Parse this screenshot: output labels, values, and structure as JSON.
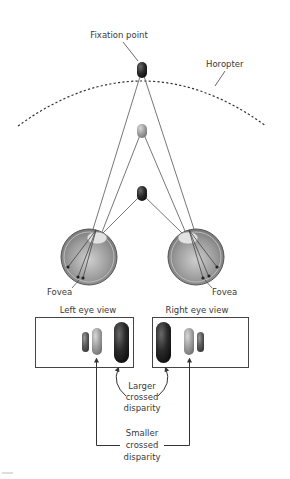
{
  "labels": {
    "fixation_point": "Fixation point",
    "horopter": "Horopter",
    "fovea_left": "Fovea",
    "fovea_right": "Fovea",
    "left_eye_view": "Left eye view",
    "right_eye_view": "Right eye view",
    "larger_line1": "Larger",
    "larger_line2": "crossed",
    "larger_line3": "disparity",
    "smaller_line1": "Smaller",
    "smaller_line2": "crossed",
    "smaller_line3": "disparity"
  },
  "objects": [
    {
      "name": "fixation-object",
      "shade": "dark",
      "position": "on horopter"
    },
    {
      "name": "middle-object",
      "shade": "light gray",
      "position": "in front of horopter"
    },
    {
      "name": "near-object",
      "shade": "dark",
      "position": "closest to eyes"
    }
  ],
  "colors": {
    "line": "#555555",
    "dark_object": "#2b2b2b",
    "light_object": "#9a9a9a",
    "eye_fill": "#8f8f8f",
    "box_stroke": "#444444"
  }
}
